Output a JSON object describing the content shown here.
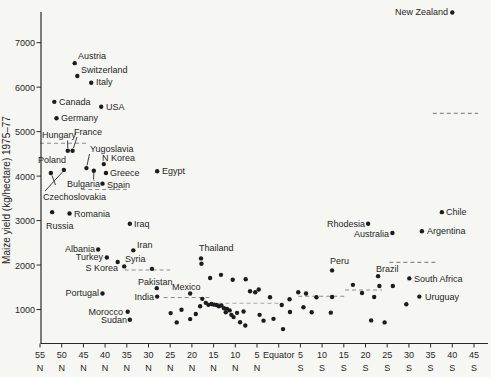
{
  "figure": {
    "background": "#f6f6f3",
    "dot_color": "#1c1c1c",
    "dash_color": "#8c8c8c",
    "dash_color_light": "#a6a6a6",
    "axis_color": "#2b2b2b",
    "text_color": "#262626"
  },
  "chart_data": {
    "type": "scatter",
    "title": "",
    "xlabel": "",
    "ylabel": "Maize yield (kg/hectare) 1975–77",
    "x_axis": {
      "note": "latitude in degrees, positive = North, negative = South",
      "range_lat": [
        55,
        -45
      ],
      "ticks": [
        {
          "lat": 55,
          "value": "55",
          "hemi": "N"
        },
        {
          "lat": 50,
          "value": "50",
          "hemi": "N"
        },
        {
          "lat": 45,
          "value": "45",
          "hemi": "N"
        },
        {
          "lat": 40,
          "value": "40",
          "hemi": "N"
        },
        {
          "lat": 35,
          "value": "35",
          "hemi": "N"
        },
        {
          "lat": 30,
          "value": "30",
          "hemi": "N"
        },
        {
          "lat": 25,
          "value": "25",
          "hemi": "N"
        },
        {
          "lat": 20,
          "value": "20",
          "hemi": "N"
        },
        {
          "lat": 15,
          "value": "15",
          "hemi": "N"
        },
        {
          "lat": 10,
          "value": "10",
          "hemi": "N"
        },
        {
          "lat": 5,
          "value": "5",
          "hemi": "N"
        },
        {
          "lat": 0,
          "value": "Equator",
          "hemi": ""
        },
        {
          "lat": -5,
          "value": "5",
          "hemi": "S"
        },
        {
          "lat": -10,
          "value": "10",
          "hemi": "S"
        },
        {
          "lat": -15,
          "value": "15",
          "hemi": "S"
        },
        {
          "lat": -20,
          "value": "20",
          "hemi": "S"
        },
        {
          "lat": -25,
          "value": "25",
          "hemi": "S"
        },
        {
          "lat": -30,
          "value": "30",
          "hemi": "S"
        },
        {
          "lat": -35,
          "value": "35",
          "hemi": "S"
        },
        {
          "lat": -40,
          "value": "40",
          "hemi": "S"
        },
        {
          "lat": -45,
          "value": "45",
          "hemi": "S"
        }
      ]
    },
    "y_axis": {
      "ticks": [
        1000,
        2000,
        3000,
        4000,
        5000,
        6000,
        7000
      ],
      "range": [
        200,
        7800
      ]
    },
    "labeled_points": [
      {
        "name": "New Zealand",
        "lat": -40,
        "yield": 7680,
        "anchor": "end",
        "lx": 448,
        "ly": 15
      },
      {
        "name": "Austria",
        "lat": 47,
        "yield": 6540,
        "anchor": "start",
        "lx": 78,
        "ly": 59
      },
      {
        "name": "Switzerland",
        "lat": 46.4,
        "yield": 6250,
        "anchor": "start",
        "lx": 81,
        "ly": 73
      },
      {
        "name": "Italy",
        "lat": 43.2,
        "yield": 6100,
        "anchor": "start",
        "lx": 96,
        "ly": 85
      },
      {
        "name": "Canada",
        "lat": 51.7,
        "yield": 5670,
        "anchor": "start",
        "lx": 59,
        "ly": 105
      },
      {
        "name": "USA",
        "lat": 40.9,
        "yield": 5560,
        "anchor": "start",
        "lx": 106,
        "ly": 110
      },
      {
        "name": "Germany",
        "lat": 51.2,
        "yield": 5300,
        "anchor": "start",
        "lx": 61,
        "ly": 121
      },
      {
        "name": "Hungary",
        "lat": 48.6,
        "yield": 4570,
        "anchor": "start",
        "lx": 42,
        "ly": 138,
        "leader": [
          67.5,
          140.5,
          67.8,
          148
        ]
      },
      {
        "name": "France",
        "lat": 47.5,
        "yield": 4570,
        "anchor": "start",
        "lx": 74,
        "ly": 135,
        "leader": [
          77,
          137,
          73.5,
          148
        ]
      },
      {
        "name": "Poland",
        "lat": 52.5,
        "yield": 4070,
        "anchor": "start",
        "lx": 38,
        "ly": 163,
        "leader": [
          55.5,
          185,
          52,
          175.5
        ]
      },
      {
        "name": "Czechoslovakia",
        "lat": 49.5,
        "yield": 4140,
        "anchor": "start",
        "lx": 43,
        "ly": 200,
        "leader": [
          45,
          191,
          62.5,
          172
        ]
      },
      {
        "name": "Yugoslavia",
        "lat": 44.3,
        "yield": 4180,
        "anchor": "start",
        "lx": 90,
        "ly": 152,
        "leader": [
          89.5,
          154,
          87,
          165.5
        ]
      },
      {
        "name": "Bulgaria",
        "lat": 42.6,
        "yield": 4120,
        "anchor": "start",
        "lx": 67,
        "ly": 187,
        "leader": [
          93.5,
          179.5,
          93.8,
          173
        ]
      },
      {
        "name": "N Korea",
        "lat": 40.3,
        "yield": 4270,
        "anchor": "start",
        "lx": 102,
        "ly": 161
      },
      {
        "name": "Greece",
        "lat": 39.8,
        "yield": 4070,
        "anchor": "start",
        "lx": 110,
        "ly": 176
      },
      {
        "name": "Spain",
        "lat": 40.6,
        "yield": 3830,
        "anchor": "start",
        "lx": 107,
        "ly": 188
      },
      {
        "name": "Egypt",
        "lat": 28,
        "yield": 4110,
        "anchor": "start",
        "lx": 162,
        "ly": 174
      },
      {
        "name": "Romania",
        "lat": 48.2,
        "yield": 3160,
        "anchor": "start",
        "lx": 74,
        "ly": 217
      },
      {
        "name": "Russia",
        "lat": 52.2,
        "yield": 3190,
        "anchor": "start",
        "lx": 46,
        "ly": 229
      },
      {
        "name": "Iraq",
        "lat": 34.3,
        "yield": 2930,
        "anchor": "start",
        "lx": 134,
        "ly": 227
      },
      {
        "name": "Albania",
        "lat": 41.6,
        "yield": 2350,
        "anchor": "end",
        "lx": 95,
        "ly": 252
      },
      {
        "name": "Iran",
        "lat": 33.5,
        "yield": 2330,
        "anchor": "start",
        "lx": 137,
        "ly": 248
      },
      {
        "name": "Turkey",
        "lat": 39.6,
        "yield": 2170,
        "anchor": "end",
        "lx": 103,
        "ly": 260
      },
      {
        "name": "Syria",
        "lat": 37.1,
        "yield": 2070,
        "anchor": "start",
        "lx": 125,
        "ly": 262
      },
      {
        "name": "S Korea",
        "lat": 35.6,
        "yield": 1970,
        "anchor": "end",
        "lx": 118,
        "ly": 271
      },
      {
        "name": "Thailand",
        "lat": 17.9,
        "yield": 2150,
        "anchor": "start",
        "lx": 199,
        "ly": 251
      },
      {
        "name": "Portugal",
        "lat": 40.6,
        "yield": 1360,
        "anchor": "end",
        "lx": 99,
        "ly": 296
      },
      {
        "name": "Pakistan",
        "lat": 28.1,
        "yield": 1480,
        "anchor": "start",
        "lx": 138,
        "ly": 285
      },
      {
        "name": "India",
        "lat": 28,
        "yield": 1290,
        "anchor": "end",
        "lx": 154,
        "ly": 300
      },
      {
        "name": "Mexico",
        "lat": 20.4,
        "yield": 1360,
        "anchor": "start",
        "lx": 172,
        "ly": 290
      },
      {
        "name": "Morocco",
        "lat": 34.8,
        "yield": 950,
        "anchor": "end",
        "lx": 123,
        "ly": 315
      },
      {
        "name": "Sudan",
        "lat": 34.3,
        "yield": 770,
        "anchor": "end",
        "lx": 127,
        "ly": 323
      },
      {
        "name": "Peru",
        "lat": -12.3,
        "yield": 1880,
        "anchor": "start",
        "lx": 330,
        "ly": 264
      },
      {
        "name": "Brazil",
        "lat": -22.9,
        "yield": 1750,
        "anchor": "start",
        "lx": 376,
        "ly": 272
      },
      {
        "name": "South Africa",
        "lat": -30.1,
        "yield": 1700,
        "anchor": "start",
        "lx": 414,
        "ly": 282
      },
      {
        "name": "Uruguay",
        "lat": -32.4,
        "yield": 1290,
        "anchor": "start",
        "lx": 425,
        "ly": 300
      },
      {
        "name": "Rhodesia",
        "lat": -20.6,
        "yield": 2930,
        "anchor": "end",
        "lx": 365,
        "ly": 227
      },
      {
        "name": "Australia",
        "lat": -26.2,
        "yield": 2720,
        "anchor": "end",
        "lx": 389,
        "ly": 237
      },
      {
        "name": "Argentina",
        "lat": -33,
        "yield": 2760,
        "anchor": "start",
        "lx": 427,
        "ly": 234
      },
      {
        "name": "Chile",
        "lat": -37.6,
        "yield": 3190,
        "anchor": "start",
        "lx": 446,
        "ly": 215
      }
    ],
    "unlabeled_points": [
      [
        29.2,
        1915
      ],
      [
        15.8,
        1710
      ],
      [
        13.3,
        1780
      ],
      [
        10.6,
        1670
      ],
      [
        7.6,
        1680
      ],
      [
        24.9,
        920
      ],
      [
        23.5,
        710
      ],
      [
        22.4,
        995
      ],
      [
        20.4,
        785
      ],
      [
        19.1,
        900
      ],
      [
        18.1,
        1075
      ],
      [
        17.8,
        2030
      ],
      [
        17.6,
        1240
      ],
      [
        16.8,
        1150
      ],
      [
        16.2,
        1105
      ],
      [
        15.5,
        1125
      ],
      [
        14.9,
        1110
      ],
      [
        14.3,
        1100
      ],
      [
        13.8,
        1075
      ],
      [
        13.2,
        1090
      ],
      [
        12.6,
        1030
      ],
      [
        12.2,
        940
      ],
      [
        11.9,
        1015
      ],
      [
        11.3,
        980
      ],
      [
        10.9,
        880
      ],
      [
        10.4,
        830
      ],
      [
        9.6,
        925
      ],
      [
        8.9,
        715
      ],
      [
        8.1,
        955
      ],
      [
        7.7,
        640
      ],
      [
        6.6,
        1410
      ],
      [
        5.4,
        1390
      ],
      [
        4.6,
        1450
      ],
      [
        4.4,
        880
      ],
      [
        3.5,
        750
      ],
      [
        2.0,
        1275
      ],
      [
        1.2,
        790
      ],
      [
        -0.7,
        1100
      ],
      [
        -1.0,
        560
      ],
      [
        -2.5,
        1230
      ],
      [
        -2.6,
        945
      ],
      [
        -4.5,
        1390
      ],
      [
        -5.7,
        1050
      ],
      [
        -6.3,
        1360
      ],
      [
        -7.6,
        940
      ],
      [
        -8.7,
        1275
      ],
      [
        -12.0,
        930
      ],
      [
        -12.3,
        1280
      ],
      [
        -17.1,
        1555
      ],
      [
        -19.2,
        1370
      ],
      [
        -21.3,
        755
      ],
      [
        -22.0,
        1280
      ],
      [
        -23.2,
        1530
      ],
      [
        -24.4,
        710
      ],
      [
        -26.3,
        1530
      ],
      [
        -29.4,
        1120
      ]
    ],
    "band_mean_lines": [
      {
        "from_lat": 55,
        "to_lat": 44,
        "yield": 4740,
        "light": false
      },
      {
        "from_lat": 45.5,
        "to_lat": 35,
        "yield": 3700,
        "light": false
      },
      {
        "from_lat": 35.5,
        "to_lat": 25,
        "yield": 1890,
        "light": false
      },
      {
        "from_lat": 26.5,
        "to_lat": 16,
        "yield": 1270,
        "light": false
      },
      {
        "from_lat": 15.5,
        "to_lat": -1,
        "yield": 1140,
        "light": true
      },
      {
        "from_lat": -4.5,
        "to_lat": -15.3,
        "yield": 1300,
        "light": false
      },
      {
        "from_lat": -15.3,
        "to_lat": -23.8,
        "yield": 1440,
        "light": false
      },
      {
        "from_lat": -25.5,
        "to_lat": -36.5,
        "yield": 2060,
        "light": false
      },
      {
        "from_lat": -35.5,
        "to_lat": -45.9,
        "yield": 5410,
        "light": false
      }
    ]
  }
}
